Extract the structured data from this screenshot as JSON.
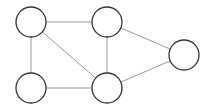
{
  "graph": {
    "type": "undirected-graph",
    "colors": {
      "background": "#ffffff",
      "edge": "#9a9a9a",
      "node_stroke": "#333333",
      "node_fill": "#ffffff"
    },
    "nodes": [
      {
        "id": "n1",
        "label": "",
        "cx": 31,
        "cy": 22,
        "r": 15
      },
      {
        "id": "n2",
        "label": "",
        "cx": 107,
        "cy": 22,
        "r": 15
      },
      {
        "id": "n3",
        "label": "",
        "cx": 31,
        "cy": 88,
        "r": 15
      },
      {
        "id": "n4",
        "label": "",
        "cx": 107,
        "cy": 88,
        "r": 15
      },
      {
        "id": "n5",
        "label": "",
        "cx": 184,
        "cy": 55,
        "r": 15
      }
    ],
    "edges": [
      {
        "from": "n1",
        "to": "n2"
      },
      {
        "from": "n1",
        "to": "n3"
      },
      {
        "from": "n1",
        "to": "n4"
      },
      {
        "from": "n2",
        "to": "n4"
      },
      {
        "from": "n2",
        "to": "n5"
      },
      {
        "from": "n3",
        "to": "n4"
      },
      {
        "from": "n4",
        "to": "n5"
      }
    ]
  }
}
